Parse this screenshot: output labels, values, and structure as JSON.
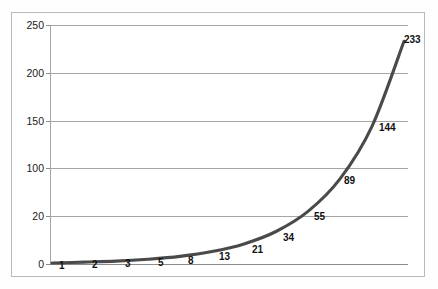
{
  "chart_data": {
    "type": "line",
    "title": "",
    "subtitle": "",
    "xlabel": "",
    "ylabel": "",
    "grid": true,
    "legend": false,
    "legend_position": "none",
    "series_color": "#4a4a4a",
    "gridline_color": "#a6a6a6",
    "frame_color": "#b9b9b9",
    "background_color": "#ffffff",
    "x": [
      1,
      2,
      3,
      4,
      5,
      6,
      7,
      8,
      9,
      10,
      11,
      12
    ],
    "values": [
      1,
      2,
      3,
      5,
      8,
      13,
      21,
      34,
      55,
      89,
      144,
      233
    ],
    "point_labels": [
      "1",
      "2",
      "3",
      "5",
      "8",
      "13",
      "21",
      "34",
      "55",
      "89",
      "144",
      "233"
    ],
    "ylim": [
      0,
      250
    ],
    "y_ticks": [
      0,
      50,
      100,
      150,
      200,
      250
    ],
    "y_tick_labels": [
      "0",
      "20",
      "100",
      "150",
      "200",
      "250"
    ],
    "xlim": [
      1,
      12
    ],
    "x_tick_labels": [],
    "annotations": "Data point values are printed beside each marker along the curve."
  },
  "axis": {
    "y_labels": {
      "t250": "250",
      "t200": "200",
      "t150": "150",
      "t100": "100",
      "t50": "20",
      "t0": "0"
    }
  },
  "points": {
    "p0": "1",
    "p1": "2",
    "p2": "3",
    "p3": "5",
    "p4": "8",
    "p5": "13",
    "p6": "21",
    "p7": "34",
    "p8": "55",
    "p9": "89",
    "p10": "144",
    "p11": "233"
  }
}
